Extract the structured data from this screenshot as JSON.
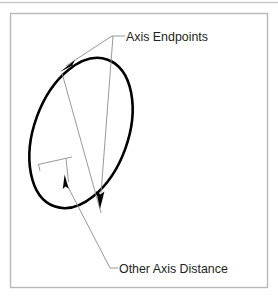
{
  "figure": {
    "type": "technical-line-diagram",
    "background_color": "#ffffff",
    "frame": {
      "name": "figure-border",
      "stroke_color": "#b9b9b9",
      "x": 10,
      "y": 13,
      "width": 258,
      "height": 275
    },
    "top_rule": {
      "name": "page-top-rule",
      "stroke_color": "#c9c9c9",
      "y": 2
    }
  },
  "labels": {
    "axis_endpoints": "Axis Endpoints",
    "other_axis_distance": "Other Axis Distance"
  },
  "colors": {
    "ellipse_stroke": "#000000",
    "leader_line": "#8c8c8c",
    "axis_line": "#8c8c8c",
    "arrowhead_fill": "#000000",
    "text": "#231f20",
    "frame": "#b9b9b9"
  },
  "geometry": {
    "ellipse": {
      "name": "main-ellipse",
      "center_x": 81,
      "center_y": 133,
      "radius_x": 47,
      "radius_y": 78,
      "rotation_deg": 20,
      "stroke_width": 2.6
    },
    "major_axis": {
      "name": "major-axis-line",
      "x1": 62,
      "y1": 73,
      "x2": 101,
      "y2": 213
    },
    "minor_axis_tick": {
      "name": "minor-axis-tick",
      "x1": 38,
      "y1": 164,
      "x2": 72,
      "y2": 157,
      "stub_x": 66,
      "stub_y_end": 181
    },
    "endpoint_top": {
      "x": 61,
      "y": 71
    },
    "endpoint_bottom": {
      "x": 100,
      "y": 206
    },
    "leader_branch": {
      "x": 113,
      "y": 36
    },
    "leader_label_stub": {
      "x1": 113,
      "y1": 36,
      "x2": 124,
      "y2": 36
    },
    "bottom_leader": {
      "x1": 65,
      "y1": 186,
      "x2": 110,
      "y2": 268,
      "x3": 117,
      "y3": 268
    },
    "small_arrow": {
      "x": 64,
      "y": 179,
      "direction": "up"
    }
  },
  "text_positions": {
    "axis_endpoints": {
      "x": 126,
      "y": 41
    },
    "other_axis_distance": {
      "x": 119,
      "y": 273
    }
  }
}
